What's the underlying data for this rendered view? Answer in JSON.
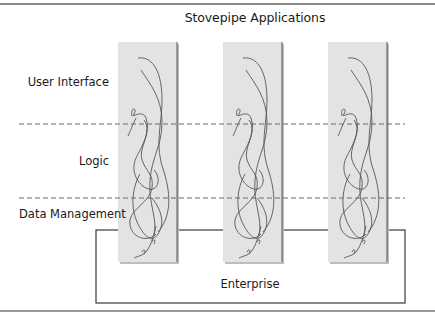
{
  "diagram": {
    "title": "Stovepipe Applications",
    "layers": [
      {
        "id": "ui",
        "label": "User Interface"
      },
      {
        "id": "logic",
        "label": "Logic"
      },
      {
        "id": "data",
        "label": "Data Management"
      }
    ],
    "stovepipes": [
      {
        "id": "app-1"
      },
      {
        "id": "app-2"
      },
      {
        "id": "app-3"
      }
    ],
    "enterprise": {
      "label": "Enterprise"
    },
    "colors": {
      "pillar_fill": "#e3e3e3",
      "pillar_edge": "#555555",
      "tangle_stroke": "#555555",
      "dash_stroke": "#6a6a6a",
      "box_stroke": "#3a3a3a",
      "rule": "#8a8a8a"
    }
  }
}
